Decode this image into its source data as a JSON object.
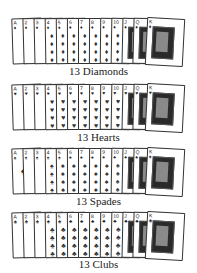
{
  "rows": [
    {
      "caption": "13 Diamonds",
      "suit": "diamonds",
      "glyph": "♦"
    },
    {
      "caption": "13 Hearts",
      "suit": "hearts",
      "glyph": "♥"
    },
    {
      "caption": "13 Spades",
      "suit": "spades",
      "glyph": "♠"
    },
    {
      "caption": "13 Clubs",
      "suit": "clubs",
      "glyph": "♣"
    }
  ],
  "ranks": [
    "A",
    "2",
    "3",
    "4",
    "5",
    "6",
    "7",
    "8",
    "9",
    "10",
    "J",
    "Q",
    "K"
  ]
}
